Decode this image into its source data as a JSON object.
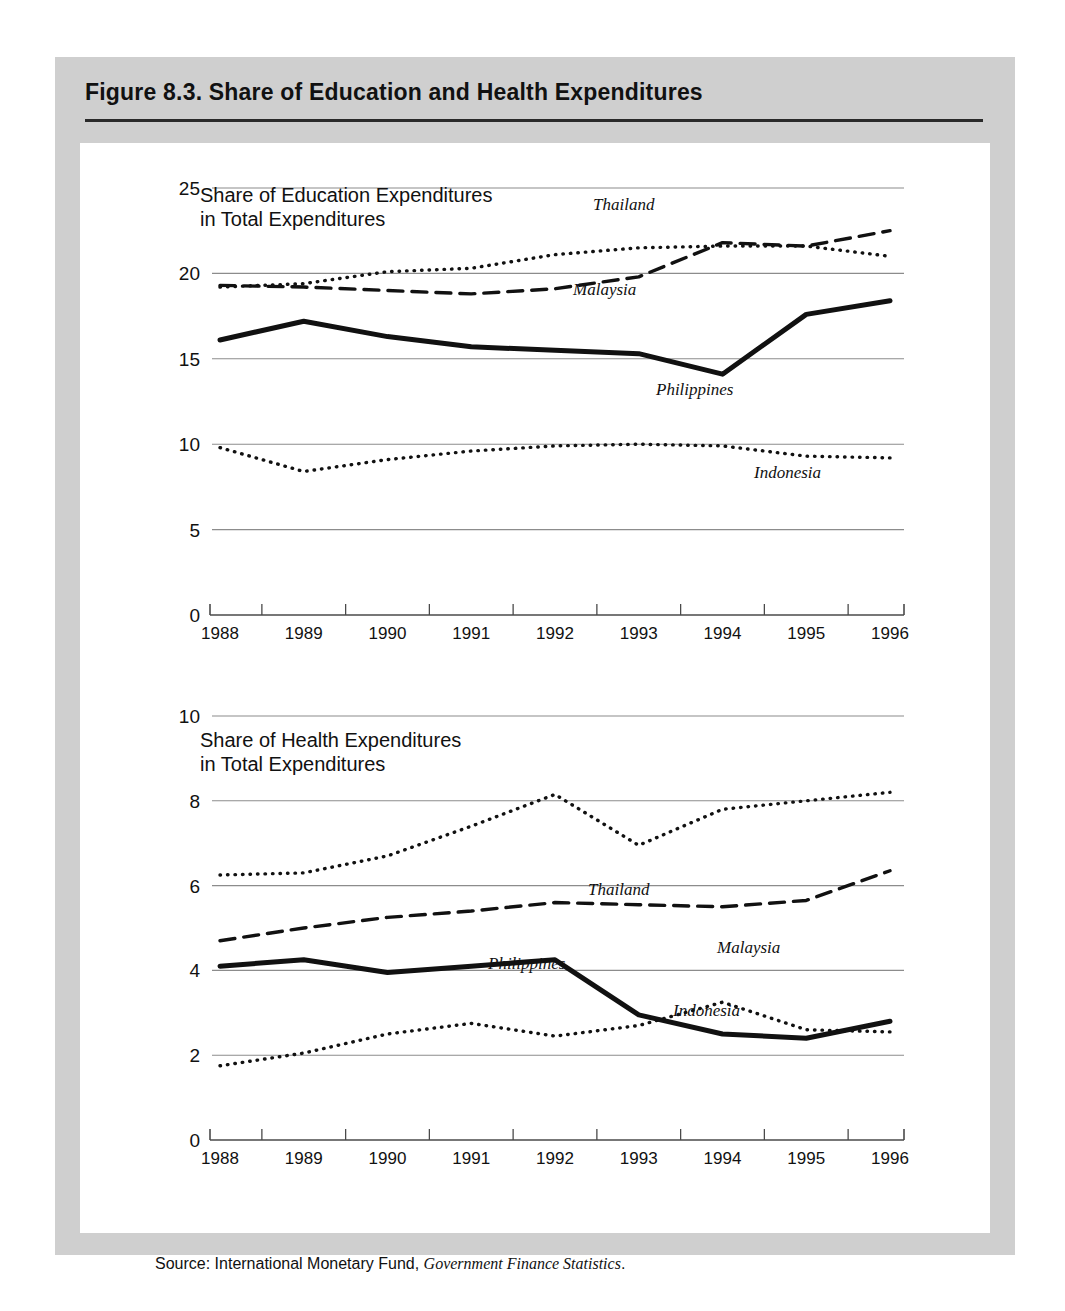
{
  "figure": {
    "title": "Figure 8.3.  Share of Education and Health Expenditures",
    "source_prefix": "Source:  International Monetary Fund, ",
    "source_italic": "Government Finance Statistics",
    "source_suffix": "."
  },
  "panels": {
    "education": {
      "block_title": "Share of Education Expenditures\nin Total Expenditures",
      "labels": {
        "thailand": "Thailand",
        "malaysia": "Malaysia",
        "philippines": "Philippines",
        "indonesia": "Indonesia"
      }
    },
    "health": {
      "block_title": "Share of Health Expenditures\nin Total Expenditures",
      "labels": {
        "thailand": "Thailand",
        "malaysia": "Malaysia",
        "philippines": "Philippines",
        "indonesia": "Indonesia"
      }
    }
  },
  "chart_data": [
    {
      "id": "education",
      "type": "line",
      "title": "Share of Education Expenditures in Total Expenditures",
      "xlabel": "",
      "ylabel": "",
      "x": [
        1988,
        1989,
        1990,
        1991,
        1992,
        1993,
        1994,
        1995,
        1996
      ],
      "xtick_labels": [
        "1988",
        "1989",
        "1990",
        "1991",
        "1992",
        "1993",
        "1994",
        "1995",
        "1996"
      ],
      "ylim": [
        0,
        25
      ],
      "yticks": [
        0,
        5,
        10,
        15,
        20,
        25
      ],
      "grid": true,
      "legend": "inline-annotations",
      "series": [
        {
          "name": "Thailand",
          "style": "dotted",
          "values": [
            19.2,
            19.4,
            20.1,
            20.3,
            21.1,
            21.5,
            21.6,
            21.6,
            21.0
          ]
        },
        {
          "name": "Malaysia",
          "style": "dashed",
          "values": [
            19.3,
            19.2,
            19.0,
            18.8,
            19.1,
            19.8,
            21.8,
            21.6,
            22.5
          ]
        },
        {
          "name": "Philippines",
          "style": "solid",
          "values": [
            16.1,
            17.2,
            16.3,
            15.7,
            15.5,
            15.3,
            14.1,
            17.6,
            18.4
          ]
        },
        {
          "name": "Indonesia",
          "style": "dotted",
          "values": [
            9.8,
            8.4,
            9.1,
            9.6,
            9.9,
            10.0,
            9.9,
            9.3,
            9.2
          ]
        }
      ]
    },
    {
      "id": "health",
      "type": "line",
      "title": "Share of Health Expenditures in Total Expenditures",
      "xlabel": "",
      "ylabel": "",
      "x": [
        1988,
        1989,
        1990,
        1991,
        1992,
        1993,
        1994,
        1995,
        1996
      ],
      "xtick_labels": [
        "1988",
        "1989",
        "1990",
        "1991",
        "1992",
        "1993",
        "1994",
        "1995",
        "1996"
      ],
      "ylim": [
        0,
        10
      ],
      "yticks": [
        0,
        2,
        4,
        6,
        8,
        10
      ],
      "grid": true,
      "legend": "inline-annotations",
      "series": [
        {
          "name": "Thailand",
          "style": "dotted",
          "values": [
            6.25,
            6.3,
            6.7,
            7.4,
            8.15,
            6.95,
            7.8,
            8.0,
            8.2
          ]
        },
        {
          "name": "Malaysia",
          "style": "dashed",
          "values": [
            4.7,
            5.0,
            5.25,
            5.4,
            5.6,
            5.55,
            5.5,
            5.65,
            6.35
          ]
        },
        {
          "name": "Philippines",
          "style": "solid",
          "values": [
            4.1,
            4.25,
            3.95,
            4.1,
            4.25,
            2.95,
            2.5,
            2.4,
            2.8
          ]
        },
        {
          "name": "Indonesia",
          "style": "dotted",
          "values": [
            1.75,
            2.05,
            2.5,
            2.75,
            2.45,
            2.7,
            3.25,
            2.6,
            2.55
          ]
        }
      ]
    }
  ]
}
